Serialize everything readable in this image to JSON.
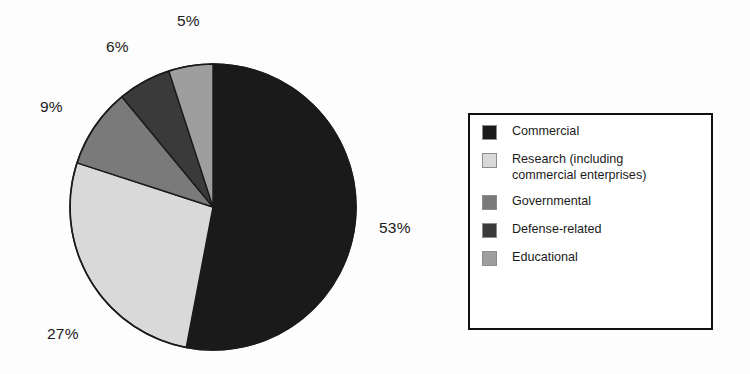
{
  "chart_data": {
    "type": "pie",
    "title": "",
    "subtitle": "",
    "xlabel": "",
    "ylabel": "",
    "legend_position": "right",
    "grid": false,
    "start_angle_deg": 0,
    "direction": "clockwise",
    "categories": [
      "Commercial",
      "Research (including commercial enterprises)",
      "Governmental",
      "Defense-related",
      "Educational"
    ],
    "values": [
      53,
      27,
      9,
      6,
      5
    ],
    "value_unit": "%",
    "data_labels": [
      "53%",
      "27%",
      "9%",
      "6%",
      "5%"
    ],
    "slice_colors": [
      "#1a1a1a",
      "#d9d9d9",
      "#7a7a7a",
      "#3a3a3a",
      "#9e9e9e"
    ],
    "slices": [
      {
        "label": "Commercial",
        "value": 53,
        "data_label": "53%",
        "color": "#1a1a1a"
      },
      {
        "label": "Research (including commercial enterprises)",
        "value": 27,
        "data_label": "27%",
        "color": "#d9d9d9"
      },
      {
        "label": "Governmental",
        "value": 9,
        "data_label": "9%",
        "color": "#7a7a7a"
      },
      {
        "label": "Defense-related",
        "value": 6,
        "data_label": "6%",
        "color": "#3a3a3a"
      },
      {
        "label": "Educational",
        "value": 5,
        "data_label": "5%",
        "color": "#9e9e9e"
      }
    ]
  },
  "pie": {
    "labels": {
      "p53": "53%",
      "p27": "27%",
      "p9": "9%",
      "p6": "6%",
      "p5": "5%"
    },
    "outline_color": "#1b1b1b"
  },
  "legend": {
    "border_color": "#111111",
    "background": "#ffffff",
    "items": [
      {
        "label": "Commercial",
        "color": "#1a1a1a"
      },
      {
        "label": "Research (including\ncommercial enterprises)",
        "color": "#d9d9d9"
      },
      {
        "label": "Governmental",
        "color": "#7a7a7a"
      },
      {
        "label": "Defense-related",
        "color": "#3a3a3a"
      },
      {
        "label": "Educational",
        "color": "#9e9e9e"
      }
    ]
  }
}
